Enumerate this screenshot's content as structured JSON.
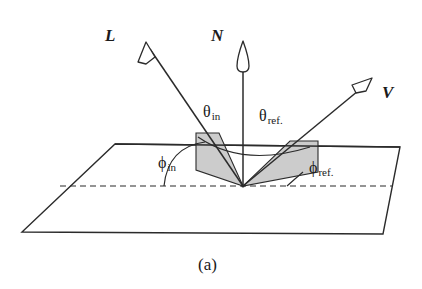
{
  "figure": {
    "caption": "(a)",
    "colors": {
      "stroke": "#2b2b2b",
      "shade_fill": "#cccccc",
      "background": "#ffffff",
      "text": "#1a1a1a"
    },
    "vectors": [
      {
        "id": "L",
        "label": "L",
        "name": "light-vector",
        "description": "incident light direction vector",
        "from": [
          243,
          186
        ],
        "to": [
          146,
          43
        ],
        "label_pos": [
          108,
          28
        ]
      },
      {
        "id": "N",
        "label": "N",
        "name": "normal-vector",
        "description": "surface normal vector",
        "from": [
          243,
          186
        ],
        "to": [
          243,
          42
        ],
        "label_pos": [
          212,
          28
        ]
      },
      {
        "id": "V",
        "label": "V",
        "name": "view-vector",
        "description": "viewing / reflected direction vector",
        "from": [
          243,
          186
        ],
        "to": [
          372,
          79
        ],
        "label_pos": [
          383,
          85
        ]
      }
    ],
    "angles": [
      {
        "id": "theta_in",
        "symbol": "θ",
        "subscript": "in",
        "name": "theta-in",
        "label_pos": [
          203,
          106
        ]
      },
      {
        "id": "theta_ref",
        "symbol": "θ",
        "subscript": "ref.",
        "name": "theta-ref",
        "label_pos": [
          259,
          110
        ]
      },
      {
        "id": "phi_in",
        "symbol": "ϕ",
        "subscript": "in",
        "name": "phi-in",
        "label_pos": [
          160,
          157
        ]
      },
      {
        "id": "phi_ref",
        "symbol": "ϕ",
        "subscript": "ref.",
        "name": "phi-ref",
        "label_pos": [
          311,
          162
        ]
      }
    ],
    "surface": {
      "name": "surface-plane",
      "corners": [
        [
          115,
          144
        ],
        [
          400,
          147
        ],
        [
          383,
          234
        ],
        [
          22,
          232
        ]
      ],
      "horizon_line": {
        "y": 144,
        "x1": 115,
        "x2": 400
      },
      "dashed_axis": {
        "y": 186,
        "x1": 60,
        "x2": 392
      },
      "origin": [
        243,
        186
      ]
    },
    "shaded_regions": [
      {
        "name": "incident-shade-polygon",
        "points": [
          [
            196,
            133
          ],
          [
            219,
            133
          ],
          [
            243,
            186
          ],
          [
            196,
            170
          ]
        ]
      },
      {
        "name": "reflected-shade-polygon",
        "points": [
          [
            290,
            141
          ],
          [
            318,
            141
          ],
          [
            318,
            172
          ],
          [
            243,
            186
          ]
        ]
      }
    ]
  }
}
